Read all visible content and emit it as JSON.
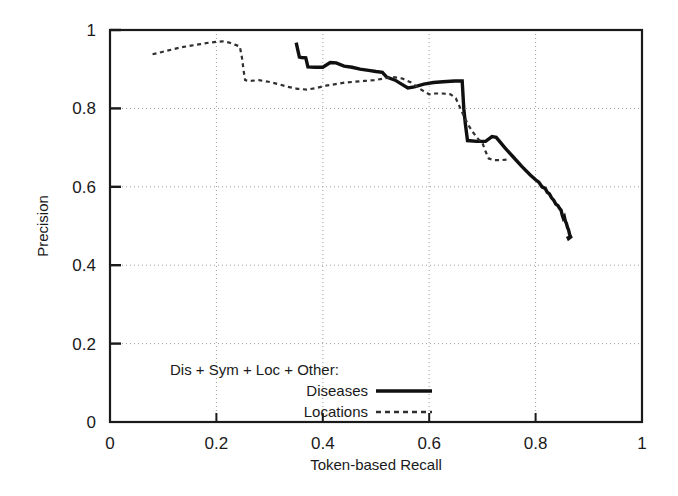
{
  "chart_data": {
    "type": "line",
    "title": "",
    "xlabel": "Token-based Recall",
    "ylabel": "Precision",
    "xlim": [
      0,
      1
    ],
    "ylim": [
      0,
      1
    ],
    "xticks": [
      "0",
      "0.2",
      "0.4",
      "0.6",
      "0.8",
      "1"
    ],
    "xtick_values": [
      0,
      0.2,
      0.4,
      0.6,
      0.8,
      1
    ],
    "yticks": [
      "0",
      "0.2",
      "0.4",
      "0.6",
      "0.8",
      "1"
    ],
    "ytick_values": [
      0,
      0.2,
      0.4,
      0.6,
      0.8,
      1
    ],
    "grid": true,
    "grid_style": "dotted",
    "legend_position": "bottom-center-inside",
    "legend_title": "Dis + Sym + Loc + Other:",
    "series": [
      {
        "name": "Diseases",
        "style": "solid",
        "color": "#101010",
        "points": [
          [
            0.35,
            0.968
          ],
          [
            0.352,
            0.955
          ],
          [
            0.356,
            0.931
          ],
          [
            0.36,
            0.93
          ],
          [
            0.368,
            0.929
          ],
          [
            0.372,
            0.906
          ],
          [
            0.386,
            0.905
          ],
          [
            0.4,
            0.905
          ],
          [
            0.414,
            0.917
          ],
          [
            0.425,
            0.916
          ],
          [
            0.44,
            0.908
          ],
          [
            0.455,
            0.905
          ],
          [
            0.47,
            0.9
          ],
          [
            0.486,
            0.897
          ],
          [
            0.5,
            0.894
          ],
          [
            0.512,
            0.892
          ],
          [
            0.52,
            0.88
          ],
          [
            0.536,
            0.872
          ],
          [
            0.548,
            0.862
          ],
          [
            0.56,
            0.852
          ],
          [
            0.572,
            0.855
          ],
          [
            0.59,
            0.862
          ],
          [
            0.608,
            0.866
          ],
          [
            0.626,
            0.868
          ],
          [
            0.648,
            0.87
          ],
          [
            0.662,
            0.87
          ],
          [
            0.665,
            0.8
          ],
          [
            0.668,
            0.76
          ],
          [
            0.672,
            0.718
          ],
          [
            0.69,
            0.716
          ],
          [
            0.706,
            0.716
          ],
          [
            0.718,
            0.728
          ],
          [
            0.726,
            0.726
          ],
          [
            0.742,
            0.7
          ],
          [
            0.758,
            0.676
          ],
          [
            0.774,
            0.652
          ],
          [
            0.79,
            0.63
          ],
          [
            0.8,
            0.618
          ],
          [
            0.806,
            0.612
          ],
          [
            0.812,
            0.6
          ],
          [
            0.818,
            0.596
          ],
          [
            0.822,
            0.586
          ],
          [
            0.826,
            0.582
          ],
          [
            0.83,
            0.572
          ],
          [
            0.834,
            0.566
          ],
          [
            0.838,
            0.556
          ],
          [
            0.842,
            0.552
          ],
          [
            0.845,
            0.545
          ],
          [
            0.848,
            0.54
          ],
          [
            0.85,
            0.528
          ],
          [
            0.852,
            0.52
          ],
          [
            0.854,
            0.524
          ],
          [
            0.856,
            0.512
          ],
          [
            0.858,
            0.506
          ],
          [
            0.86,
            0.496
          ],
          [
            0.862,
            0.49
          ],
          [
            0.864,
            0.478
          ],
          [
            0.866,
            0.472
          ],
          [
            0.862,
            0.468
          ],
          [
            0.86,
            0.474
          ]
        ]
      },
      {
        "name": "Locations",
        "style": "dotted",
        "color": "#303030",
        "points": [
          [
            0.08,
            0.938
          ],
          [
            0.098,
            0.944
          ],
          [
            0.116,
            0.95
          ],
          [
            0.134,
            0.956
          ],
          [
            0.152,
            0.96
          ],
          [
            0.17,
            0.964
          ],
          [
            0.188,
            0.968
          ],
          [
            0.2,
            0.97
          ],
          [
            0.212,
            0.971
          ],
          [
            0.224,
            0.968
          ],
          [
            0.236,
            0.962
          ],
          [
            0.244,
            0.958
          ],
          [
            0.248,
            0.93
          ],
          [
            0.251,
            0.898
          ],
          [
            0.254,
            0.872
          ],
          [
            0.262,
            0.87
          ],
          [
            0.28,
            0.872
          ],
          [
            0.298,
            0.868
          ],
          [
            0.316,
            0.862
          ],
          [
            0.334,
            0.855
          ],
          [
            0.352,
            0.85
          ],
          [
            0.37,
            0.848
          ],
          [
            0.388,
            0.852
          ],
          [
            0.406,
            0.858
          ],
          [
            0.424,
            0.862
          ],
          [
            0.442,
            0.866
          ],
          [
            0.46,
            0.868
          ],
          [
            0.478,
            0.87
          ],
          [
            0.496,
            0.872
          ],
          [
            0.514,
            0.876
          ],
          [
            0.532,
            0.88
          ],
          [
            0.55,
            0.876
          ],
          [
            0.566,
            0.866
          ],
          [
            0.58,
            0.852
          ],
          [
            0.592,
            0.842
          ],
          [
            0.6,
            0.836
          ],
          [
            0.612,
            0.838
          ],
          [
            0.626,
            0.838
          ],
          [
            0.64,
            0.836
          ],
          [
            0.65,
            0.826
          ],
          [
            0.656,
            0.808
          ],
          [
            0.662,
            0.79
          ],
          [
            0.668,
            0.772
          ],
          [
            0.676,
            0.752
          ],
          [
            0.684,
            0.736
          ],
          [
            0.692,
            0.722
          ],
          [
            0.7,
            0.712
          ],
          [
            0.706,
            0.69
          ],
          [
            0.712,
            0.672
          ],
          [
            0.722,
            0.668
          ],
          [
            0.736,
            0.668
          ],
          [
            0.748,
            0.67
          ]
        ]
      }
    ]
  },
  "legend": {
    "title": "Dis + Sym + Loc + Other:",
    "entries": [
      {
        "label": "Diseases",
        "style": "solid"
      },
      {
        "label": "Locations",
        "style": "dotted"
      }
    ]
  },
  "axes": {
    "x_title": "Token-based Recall",
    "y_title": "Precision"
  }
}
